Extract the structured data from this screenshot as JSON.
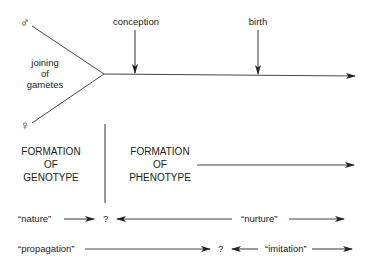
{
  "symbols": {
    "male": "♂",
    "female": "♀"
  },
  "top": {
    "joining": [
      "joining",
      "of",
      "gametes"
    ],
    "conception": "conception",
    "birth": "birth"
  },
  "formation": {
    "genotype": [
      "FORMATION",
      "OF",
      "GENOTYPE"
    ],
    "phenotype": [
      "FORMATION",
      "OF",
      "PHENOTYPE"
    ]
  },
  "rows": {
    "nature": "“nature”",
    "nature_q": "?",
    "nurture": "“nurture”",
    "propagation": "“propagation”",
    "propagation_q": "?",
    "imitation": "“imitation”"
  },
  "colors": {
    "line": "#333333",
    "text": "#1a1a1a",
    "background": "#ffffff"
  }
}
